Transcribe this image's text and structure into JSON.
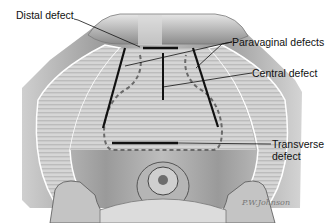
{
  "diagram": {
    "labels": {
      "distal": "Distal defect",
      "paravaginal": "Paravaginal defects",
      "central": "Central defect",
      "transverse_line1": "Transverse",
      "transverse_line2": "defect"
    },
    "signature": "P.W.Johnson",
    "colors": {
      "background": "#ffffff",
      "tissue_light": "#d9d9d9",
      "tissue_mid": "#a8a8a8",
      "tissue_dark": "#6e6e6e",
      "defect_line": "#111111",
      "dashed_outline": "#6a6a6a",
      "label_text": "#111111"
    }
  }
}
